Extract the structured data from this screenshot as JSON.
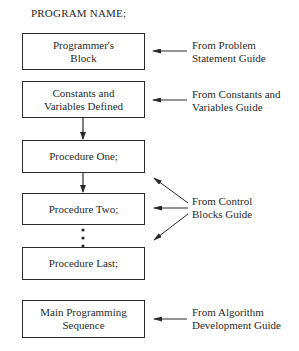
{
  "diagram": {
    "title": "PROGRAM NAME;",
    "blocks": [
      {
        "line1": "Programmer's",
        "line2": "Block"
      },
      {
        "line1": "Constants and",
        "line2": "Variables Defined"
      },
      {
        "line1": "Procedure One;",
        "line2": ""
      },
      {
        "line1": "Procedure Two;",
        "line2": ""
      },
      {
        "line1": "Procedure Last;",
        "line2": ""
      },
      {
        "line1": "Main Programming",
        "line2": "Sequence"
      }
    ],
    "sources": [
      {
        "line1": "From Problem",
        "line2": "Statement Guide",
        "targets": [
          "Programmer's Block"
        ]
      },
      {
        "line1": "From Constants and",
        "line2": "Variables Guide",
        "targets": [
          "Constants and Variables Defined"
        ]
      },
      {
        "line1": "From Control",
        "line2": "Blocks Guide",
        "targets": [
          "Procedure One;",
          "Procedure Two;",
          "Procedure Last;"
        ]
      },
      {
        "line1": "From Algorithm",
        "line2": "Development Guide",
        "targets": [
          "Main Programming Sequence"
        ]
      }
    ],
    "ellipsis": "⋮",
    "colors": {
      "line": "#2a2a2a",
      "background": "#ffffff"
    }
  }
}
